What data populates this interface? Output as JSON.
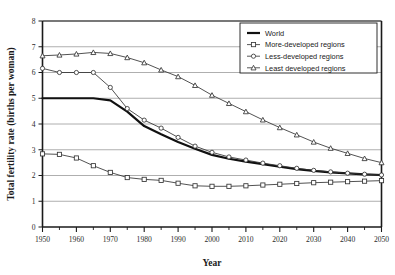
{
  "chart_data": {
    "type": "line",
    "title": "",
    "xlabel": "Year",
    "ylabel": "Total fertility rate (births per woman)",
    "xlim": [
      1950,
      2050
    ],
    "ylim": [
      0,
      8
    ],
    "xticks": [
      1950,
      1960,
      1970,
      1980,
      1990,
      2000,
      2010,
      2020,
      2030,
      2040,
      2050
    ],
    "xtick_labels": [
      "1950",
      "1960",
      "1970",
      "1980",
      "1990",
      "2000",
      "2010",
      "2020",
      "2030",
      "2040",
      "2050"
    ],
    "xminor_step": 5,
    "yticks": [
      0,
      1,
      2,
      3,
      4,
      5,
      6,
      7,
      8
    ],
    "ytick_labels": [
      "0",
      "1",
      "2",
      "3",
      "4",
      "5",
      "6",
      "7",
      "8"
    ],
    "grid": "horizontal",
    "legend_position": "top-right",
    "x": [
      1950,
      1955,
      1960,
      1965,
      1970,
      1975,
      1980,
      1985,
      1990,
      1995,
      2000,
      2005,
      2010,
      2015,
      2020,
      2025,
      2030,
      2035,
      2040,
      2045,
      2050
    ],
    "series": [
      {
        "name": "World",
        "marker": "none",
        "line": "solid-thick",
        "color": "#111111",
        "values": [
          5.0,
          5.0,
          5.0,
          5.0,
          4.92,
          4.48,
          3.92,
          3.6,
          3.3,
          3.04,
          2.8,
          2.65,
          2.54,
          2.44,
          2.34,
          2.25,
          2.18,
          2.12,
          2.08,
          2.04,
          2.02
        ]
      },
      {
        "name": "More-developed regions",
        "marker": "square",
        "line": "solid-thin",
        "color": "#333333",
        "values": [
          2.84,
          2.82,
          2.68,
          2.38,
          2.12,
          1.92,
          1.85,
          1.81,
          1.7,
          1.6,
          1.58,
          1.58,
          1.6,
          1.63,
          1.66,
          1.69,
          1.72,
          1.74,
          1.76,
          1.78,
          1.8
        ]
      },
      {
        "name": "Less-developed regions",
        "marker": "circle",
        "line": "solid-thin",
        "color": "#333333",
        "values": [
          6.16,
          6.0,
          6.0,
          6.0,
          5.42,
          4.6,
          4.15,
          3.84,
          3.48,
          3.14,
          2.9,
          2.72,
          2.6,
          2.48,
          2.38,
          2.28,
          2.2,
          2.14,
          2.09,
          2.05,
          2.02
        ]
      },
      {
        "name": "Least developed regions",
        "marker": "triangle",
        "line": "solid-thin",
        "color": "#333333",
        "values": [
          6.65,
          6.68,
          6.72,
          6.78,
          6.74,
          6.58,
          6.38,
          6.1,
          5.84,
          5.5,
          5.12,
          4.8,
          4.48,
          4.16,
          3.86,
          3.58,
          3.3,
          3.06,
          2.86,
          2.66,
          2.5
        ]
      }
    ]
  },
  "legend": {
    "items": [
      {
        "label": "World",
        "marker": "none"
      },
      {
        "label": "More-developed regions",
        "marker": "square"
      },
      {
        "label": "Less-developed regions",
        "marker": "circle"
      },
      {
        "label": "Least developed regions",
        "marker": "triangle"
      }
    ]
  },
  "colors": {
    "axis": "#1a1a1a",
    "grid": "#9a9a9a",
    "world_line": "#111111",
    "region_line": "#3a3a3a",
    "background": "#ffffff"
  }
}
